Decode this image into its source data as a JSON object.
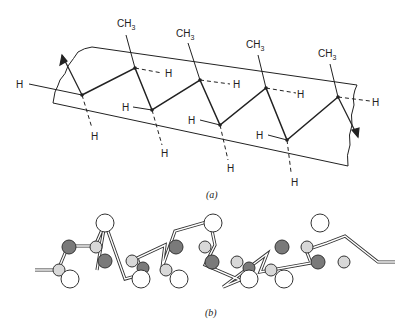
{
  "figure": {
    "part_a": {
      "caption": "(a)",
      "description": "Isotactic polypropylene zigzag chain on a plane",
      "methyl_label": "CH",
      "methyl_subscript": "3",
      "hydrogen_label": "H",
      "methyl_groups": [
        "CH3",
        "CH3",
        "CH3",
        "CH3"
      ],
      "hydrogen_count": 12
    },
    "part_b": {
      "caption": "(b)",
      "description": "Ball-and-stick helical model"
    },
    "colors": {
      "line": "#222222",
      "atom_dark": "#7a7a7a",
      "atom_light": "#d8d8d8",
      "atom_white": "#ffffff"
    }
  }
}
